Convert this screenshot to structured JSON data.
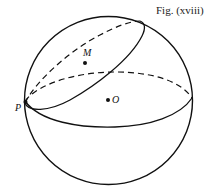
{
  "figure": {
    "caption": "Fig. (xviii)",
    "labels": {
      "P": "P",
      "M": "M",
      "O": "O"
    },
    "colors": {
      "stroke": "#111111",
      "background": "#ffffff"
    }
  }
}
